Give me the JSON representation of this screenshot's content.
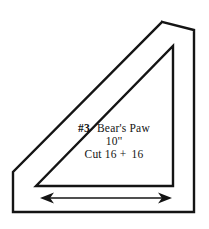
{
  "document": {
    "kind": "quilt-template-diagram",
    "background_color": "#FFFFFF",
    "ink_color": "#141414"
  },
  "labels": {
    "pattern_number": "#3",
    "pattern_name": "Bear's Paw",
    "finished_size": "10''",
    "cut_instruction": "Cut 16 + 16",
    "cut_word": "Cut",
    "cut_count_a": "16",
    "cut_plus": "+",
    "cut_count_b": "16"
  },
  "shapes": {
    "outer_outline": {
      "name": "seam-allowance-outline",
      "points": "162,22 194,30 194,212 13,212 13,172",
      "stroke": "#141414",
      "stroke_width": 2.4,
      "fill": "none"
    },
    "inner_triangle": {
      "name": "cutting-line-triangle",
      "points": "173,46 173,186 36,186",
      "stroke": "#141414",
      "stroke_width": 2.4,
      "fill": "none"
    }
  },
  "grain_arrow": {
    "name": "grain-line-arrow",
    "x_start": 40,
    "x_end": 172,
    "y": 198,
    "shaft_width": 1.6,
    "head_length": 14,
    "head_half_height": 5.5,
    "color": "#141414"
  }
}
